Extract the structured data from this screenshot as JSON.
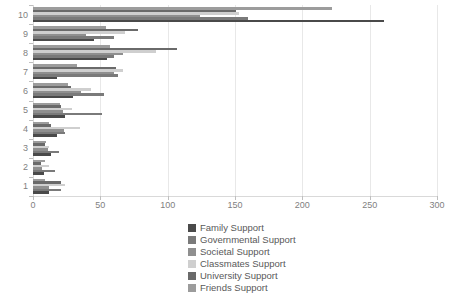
{
  "chart_data": {
    "type": "bar",
    "orientation": "horizontal",
    "title": "",
    "xlabel": "",
    "ylabel": "",
    "categories": [
      "1",
      "2",
      "3",
      "4",
      "5",
      "6",
      "7",
      "8",
      "9",
      "10"
    ],
    "series": [
      {
        "name": "Family Support",
        "color": "#4a4a4a",
        "values": [
          12,
          8,
          13,
          18,
          24,
          30,
          18,
          55,
          45,
          261
        ]
      },
      {
        "name": "Governmental Support",
        "color": "#7a7a7a",
        "values": [
          21,
          16,
          19,
          24,
          51,
          53,
          63,
          60,
          60,
          160
        ]
      },
      {
        "name": "Societal Support",
        "color": "#8f8f8f",
        "values": [
          12,
          7,
          11,
          23,
          22,
          36,
          60,
          67,
          39,
          124
        ]
      },
      {
        "name": "Classmates Support",
        "color": "#cfcfcf",
        "values": [
          24,
          12,
          12,
          35,
          29,
          43,
          67,
          91,
          68,
          153
        ]
      },
      {
        "name": "University Support",
        "color": "#6a6a6a",
        "values": [
          21,
          6,
          9,
          13,
          21,
          28,
          62,
          107,
          78,
          151
        ]
      },
      {
        "name": "Friends Support",
        "color": "#9c9c9c",
        "values": [
          9,
          9,
          10,
          12,
          20,
          26,
          33,
          57,
          54,
          222
        ]
      }
    ],
    "series_stack_order_in_cluster": "first series at bottom of cluster, last series at top",
    "x_axis": {
      "min": 0,
      "max": 300,
      "tick_interval": 50,
      "ticks": [
        0,
        50,
        100,
        150,
        200,
        250,
        300
      ]
    },
    "y_axis_note": "category 1 at bottom, category 10 at top",
    "grid": true,
    "legend_position": "bottom-center"
  },
  "colors": {
    "background": "#ffffff",
    "gridline": "#e8e8e8",
    "axis_line": "#d9d9d9",
    "tick_mark": "#bfbfbf",
    "axis_label_text": "#7f7f7f",
    "legend_text": "#595959"
  }
}
